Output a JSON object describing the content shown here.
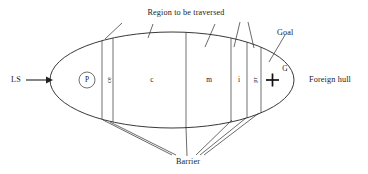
{
  "figure": {
    "type": "schematic-cross-section",
    "background_color": "#ffffff",
    "line_color": "#222222",
    "width": 368,
    "height": 174
  },
  "annotations": {
    "top_title": "Region to be traversed",
    "goal_label": "Goal",
    "bottom_label": "Barrier",
    "left_label": "LS",
    "right_label": "Foreign hull"
  },
  "hull": {
    "shape": "ellipse",
    "center_x": 172,
    "center_y": 80,
    "radius_x": 122,
    "radius_y": 48
  },
  "nodes": {
    "start_label": "P",
    "goal_marker_label": "G",
    "goal_marker_glyph": "+"
  },
  "zones": [
    {
      "id": "zone-ce",
      "label": "ce",
      "orientation": "vertical",
      "x_center": 108,
      "kind": "narrow-band"
    },
    {
      "id": "zone-c",
      "label": "c",
      "orientation": "horizontal",
      "x_center": 152,
      "kind": "wide"
    },
    {
      "id": "zone-m",
      "label": "m",
      "orientation": "horizontal",
      "x_center": 209,
      "kind": "wide"
    },
    {
      "id": "zone-i",
      "label": "i",
      "orientation": "horizontal",
      "x_center": 239,
      "kind": "medium"
    },
    {
      "id": "zone-pr",
      "label": "pr",
      "orientation": "vertical",
      "x_center": 254,
      "kind": "narrow-band"
    }
  ],
  "dividers_x": [
    102,
    113,
    186,
    231,
    247,
    261
  ],
  "icons": {
    "flow_arrow": "arrow-right-icon",
    "goal_cross": "plus-marker-icon",
    "start_circle": "circled-node-icon"
  }
}
